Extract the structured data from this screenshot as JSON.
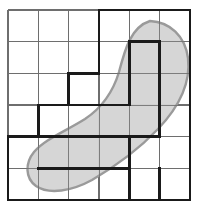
{
  "figure": {
    "title": "",
    "colors": {
      "background": "#ffffff",
      "grid_line": "#6e6e6e",
      "bold_line": "#1a1a1a",
      "region_fill": "#d4d4d4",
      "region_stroke": "#9a9a9a"
    },
    "grid": {
      "rows": 6,
      "columns": 6,
      "cell_width": 30.33,
      "cell_height": 31.67,
      "x_left": 8,
      "x_right": 190,
      "y_top": 10,
      "y_bottom": 200,
      "x_lines": [
        8,
        38.3,
        68.7,
        99,
        129.3,
        159.7,
        190
      ],
      "y_lines": [
        10,
        41.7,
        73.3,
        105,
        136.7,
        168.3,
        200
      ],
      "line_width_thin": 1.1,
      "line_width_bold": 2.6
    },
    "region": {
      "type": "closed-curve",
      "fill": "#d4d4d4",
      "stroke": "#9a9a9a",
      "stroke_width": 2.4,
      "bounds": {
        "x_min": 27,
        "x_max": 189,
        "y_min": 21,
        "y_max": 192
      },
      "path": "M 150 21 C 170 22 185 36 188 58 C 191 84 178 108 158 129 C 139 149 116 166 92 180 C 72 191 49 195 36 186 C 25 178 25 163 34 152 C 45 139 66 131 85 119 C 103 107 113 92 119 72 C 125 49 131 27 150 21 Z"
    },
    "inner_polyomino": {
      "description": "Heavy stepped outline of the squares wholly contained in the region",
      "cell_count": 11,
      "cells": [
        {
          "col": 4,
          "row": 1
        },
        {
          "col": 5,
          "row": 1
        },
        {
          "col": 4,
          "row": 2
        },
        {
          "col": 5,
          "row": 2
        },
        {
          "col": 3,
          "row": 3
        },
        {
          "col": 4,
          "row": 3
        },
        {
          "col": 5,
          "row": 3
        },
        {
          "col": 2,
          "row": 4
        },
        {
          "col": 3,
          "row": 4
        },
        {
          "col": 4,
          "row": 4
        },
        {
          "col": 5,
          "row": 4
        }
      ],
      "bold_segments": [
        {
          "kind": "horizontal",
          "y": 10,
          "x1": 99,
          "x2": 190
        },
        {
          "kind": "vertical",
          "x": 99,
          "y1": 10,
          "y2": 73.3
        },
        {
          "kind": "horizontal",
          "y": 41.7,
          "x1": 129.3,
          "x2": 159.7
        },
        {
          "kind": "vertical",
          "x": 129.3,
          "y1": 41.7,
          "y2": 105
        },
        {
          "kind": "vertical",
          "x": 159.7,
          "y1": 41.7,
          "y2": 136.7
        },
        {
          "kind": "horizontal",
          "y": 73.3,
          "x1": 68.7,
          "x2": 99
        },
        {
          "kind": "vertical",
          "x": 68.7,
          "y1": 73.3,
          "y2": 105
        },
        {
          "kind": "horizontal",
          "y": 105,
          "x1": 38.3,
          "x2": 129.3
        },
        {
          "kind": "vertical",
          "x": 38.3,
          "y1": 105,
          "y2": 136.7
        },
        {
          "kind": "horizontal",
          "y": 136.7,
          "x1": 8,
          "x2": 159.7
        },
        {
          "kind": "horizontal",
          "y": 168.3,
          "x1": 38.3,
          "x2": 129.3
        },
        {
          "kind": "vertical",
          "x": 129.3,
          "y1": 136.7,
          "y2": 200
        },
        {
          "kind": "vertical",
          "x": 8,
          "y1": 136.7,
          "y2": 200
        },
        {
          "kind": "horizontal",
          "y": 200,
          "x1": 8,
          "x2": 190
        },
        {
          "kind": "vertical",
          "x": 190,
          "y1": 10,
          "y2": 200
        },
        {
          "kind": "vertical",
          "x": 159.7,
          "y1": 168.3,
          "y2": 200
        }
      ]
    }
  }
}
